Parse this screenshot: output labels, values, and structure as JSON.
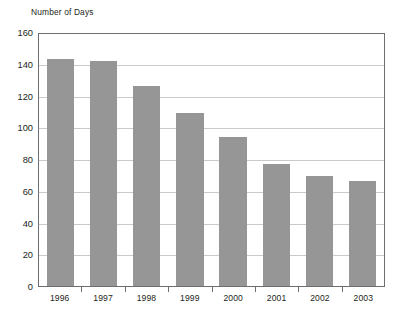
{
  "chart_data": {
    "type": "bar",
    "title": "",
    "ylabel": "Number of Days",
    "xlabel": "",
    "categories": [
      "1996",
      "1997",
      "1998",
      "1999",
      "2000",
      "2001",
      "2002",
      "2003"
    ],
    "values": [
      143,
      142,
      126,
      109,
      94,
      77,
      69,
      66
    ],
    "series": [
      {
        "name": "Number of Days",
        "values": [
          143,
          142,
          126,
          109,
          94,
          77,
          69,
          66
        ]
      }
    ],
    "ylim": [
      0,
      160
    ],
    "ytick_step": 20,
    "yticks": [
      "160",
      "140",
      "120",
      "100",
      "80",
      "60",
      "40",
      "20",
      "0"
    ],
    "ytick_values": [
      160,
      140,
      120,
      100,
      80,
      60,
      40,
      20,
      0
    ],
    "grid": true,
    "grid_axis": "y",
    "legend": false,
    "legend_position": "none",
    "bar_color": "#969696",
    "grid_color": "#c9cacc",
    "axis_color": "#6d6e71",
    "text_color": "#231f20",
    "background_color": "#ffffff"
  }
}
